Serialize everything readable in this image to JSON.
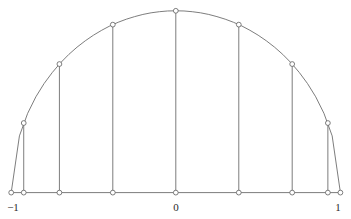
{
  "figure": {
    "title": "",
    "background_color": "#ffffff",
    "width": 351,
    "height": 219
  },
  "style": {
    "curve_color": "#6e6e6e",
    "axis_color": "#6e6e6e",
    "ordinate_color": "#6e6e6e",
    "marker_fill": "#ffffff",
    "marker_stroke": "#5e5e5e",
    "label_color": "#2a2a2a",
    "line_width": 0.9,
    "marker_radius": 2.4
  },
  "axis": {
    "x_label_left": "−1",
    "x_label_center": "0",
    "x_label_right": "1",
    "x_min": -1,
    "x_max": 1,
    "y_min": 0,
    "y_max": 1,
    "grid": false,
    "baseline_y_value": 0
  },
  "chart_data": {
    "type": "line",
    "title": "",
    "subtitle": "",
    "xlabel": "",
    "ylabel": "",
    "xlim": [
      -1,
      1
    ],
    "ylim": [
      0,
      1
    ],
    "grid": false,
    "legend": false,
    "legend_position": "none",
    "curve": {
      "name": "upper semicircle",
      "equation": "y = sqrt(1 - x^2)",
      "sampled_x": [
        -1.0,
        -0.95,
        -0.9,
        -0.85,
        -0.8,
        -0.75,
        -0.7,
        -0.65,
        -0.6,
        -0.55,
        -0.5,
        -0.45,
        -0.4,
        -0.35,
        -0.3,
        -0.25,
        -0.2,
        -0.15,
        -0.1,
        -0.05,
        0.0,
        0.05,
        0.1,
        0.15,
        0.2,
        0.25,
        0.3,
        0.35,
        0.4,
        0.45,
        0.5,
        0.55,
        0.6,
        0.65,
        0.7,
        0.75,
        0.8,
        0.85,
        0.9,
        0.95,
        1.0
      ],
      "sampled_y": [
        0.0,
        0.312,
        0.436,
        0.527,
        0.6,
        0.661,
        0.714,
        0.76,
        0.8,
        0.835,
        0.866,
        0.893,
        0.917,
        0.937,
        0.954,
        0.968,
        0.98,
        0.989,
        0.995,
        0.999,
        1.0,
        0.999,
        0.995,
        0.989,
        0.98,
        0.968,
        0.954,
        0.937,
        0.917,
        0.893,
        0.866,
        0.835,
        0.8,
        0.76,
        0.714,
        0.661,
        0.6,
        0.527,
        0.436,
        0.312,
        0.0
      ]
    },
    "nodes": {
      "name": "Chebyshev nodes cos(kπ/8), k = 0..8",
      "count": 9,
      "x": [
        -1.0,
        -0.9239,
        -0.7071,
        -0.3827,
        0.0,
        0.3827,
        0.7071,
        0.9239,
        1.0
      ],
      "y": [
        0.0,
        0.3827,
        0.7071,
        0.9239,
        1.0,
        0.9239,
        0.7071,
        0.3827,
        0.0
      ]
    },
    "ordinates": {
      "description": "vertical segments from each node on the semicircle down to the x-axis",
      "count": 9
    },
    "annotations": []
  }
}
